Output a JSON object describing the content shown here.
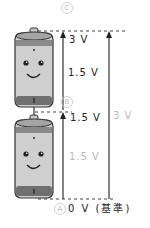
{
  "diagram": {
    "points": [
      {
        "id": "C",
        "label": "C",
        "voltage": "3 V"
      },
      {
        "id": "B",
        "label": "B",
        "voltage": "1.5 V"
      },
      {
        "id": "A",
        "label": "A",
        "voltage": "0 V",
        "note": "（基準）"
      }
    ],
    "labels": {
      "top_voltage": "3 V",
      "upper_segment": "1.5 V",
      "middle_voltage": "1.5 V",
      "lower_segment": "1.5 V",
      "total_span": "3 V",
      "bottom": "0 V (基準)"
    },
    "batteries": [
      {
        "position": "top",
        "face": "smile"
      },
      {
        "position": "bottom",
        "face": "smile"
      }
    ],
    "colors": {
      "battery_body": "#cfcfcf",
      "battery_band": "#7a7a7a",
      "outline": "#333333",
      "light_label": "#b8b8b8"
    }
  }
}
